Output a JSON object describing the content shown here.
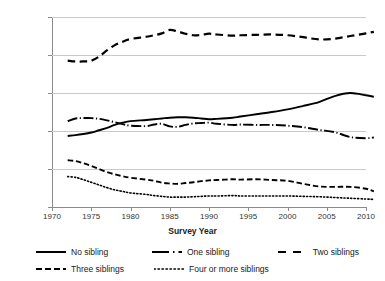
{
  "chart_data": {
    "type": "line",
    "title": "",
    "xlabel": "Survey Year",
    "ylabel": "Per Cent",
    "xlim": [
      1970,
      2010
    ],
    "ylim": [
      0,
      50
    ],
    "grid": true,
    "legend_position": "bottom",
    "xticks": [
      "1970",
      "1975",
      "1980",
      "1985",
      "1990",
      "1995",
      "2000",
      "2005",
      "2010"
    ],
    "yticks": [
      "0",
      "10",
      "20",
      "30",
      "40",
      "50"
    ],
    "x": [
      1972,
      1973,
      1974,
      1975,
      1976,
      1977,
      1978,
      1979,
      1980,
      1982,
      1983,
      1984,
      1985,
      1986,
      1987,
      1988,
      1989,
      1990,
      1991,
      1993,
      1994,
      1996,
      1998,
      2000,
      2002,
      2004,
      2006,
      2008,
      2010,
      2011
    ],
    "series": [
      {
        "name": "No sibling",
        "style": "solid",
        "values": [
          18.7,
          18.9,
          19.2,
          19.6,
          20.2,
          20.8,
          21.6,
          22.2,
          22.6,
          22.9,
          23.1,
          23.3,
          23.5,
          23.6,
          23.6,
          23.5,
          23.3,
          23.1,
          23.2,
          23.5,
          23.8,
          24.4,
          25.0,
          25.7,
          26.6,
          27.6,
          29.2,
          30.0,
          29.4,
          29.0
        ]
      },
      {
        "name": "One sibling",
        "style": "long-dash-dot",
        "values": [
          22.6,
          23.3,
          23.4,
          23.4,
          23.2,
          22.8,
          22.3,
          21.8,
          21.4,
          21.3,
          21.7,
          21.9,
          21.2,
          21.1,
          21.6,
          22.0,
          22.1,
          22.2,
          21.9,
          21.6,
          21.7,
          21.6,
          21.6,
          21.4,
          21.0,
          20.3,
          19.7,
          18.4,
          18.1,
          18.3
        ]
      },
      {
        "name": "Two siblings",
        "style": "long-dash",
        "values": [
          38.5,
          38.3,
          38.3,
          38.5,
          39.6,
          41.2,
          42.6,
          43.5,
          44.2,
          44.8,
          45.2,
          45.7,
          46.6,
          46.2,
          45.6,
          45.2,
          45.3,
          45.6,
          45.4,
          45.1,
          45.2,
          45.3,
          45.4,
          45.2,
          44.7,
          44.1,
          44.3,
          45.0,
          45.7,
          46.1
        ]
      },
      {
        "name": "Three siblings",
        "style": "medium-dash",
        "values": [
          12.3,
          12.1,
          11.5,
          10.8,
          10.0,
          9.2,
          8.6,
          8.1,
          7.7,
          7.2,
          6.9,
          6.4,
          6.2,
          6.1,
          6.3,
          6.5,
          6.8,
          7.0,
          7.1,
          7.3,
          7.2,
          7.3,
          7.1,
          6.9,
          6.1,
          5.4,
          5.3,
          5.3,
          4.8,
          4.1
        ]
      },
      {
        "name": "Four or more siblings",
        "style": "dotted",
        "values": [
          8.0,
          7.8,
          7.2,
          6.5,
          5.8,
          5.1,
          4.5,
          4.1,
          3.7,
          3.3,
          3.0,
          2.8,
          2.6,
          2.6,
          2.6,
          2.7,
          2.8,
          2.9,
          2.9,
          3.0,
          2.9,
          2.9,
          2.9,
          2.9,
          2.8,
          2.7,
          2.5,
          2.3,
          2.1,
          2.0
        ]
      }
    ]
  },
  "legend": {
    "items": [
      {
        "label": "No sibling"
      },
      {
        "label": "One sibling"
      },
      {
        "label": "Two siblings"
      },
      {
        "label": "Three siblings"
      },
      {
        "label": "Four or more siblings"
      }
    ]
  },
  "colors": {
    "line": "#000000",
    "grid": "#c9c9c9",
    "axis": "#8a8a8a",
    "text": "#1a1a1a"
  }
}
